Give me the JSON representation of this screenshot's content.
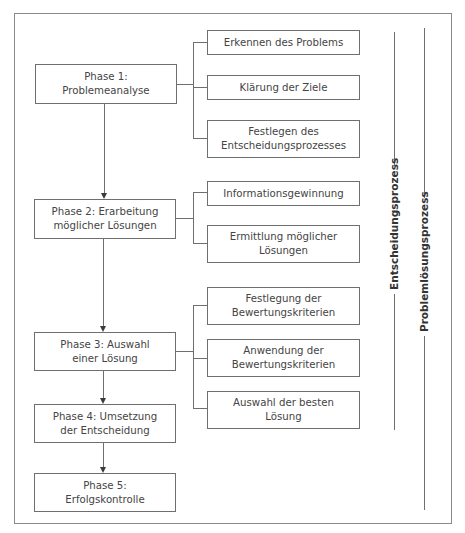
{
  "phases": [
    {
      "label": "Phase 1:\nProblemeanalyse",
      "line1": "Phase 1:",
      "line2": "Problemeanalyse"
    },
    {
      "label": "Phase 2: Erarbeitung möglicher Lösungen",
      "line1": "Phase 2: Erarbeitung",
      "line2": "möglicher Lösungen"
    },
    {
      "label": "Phase 3: Auswahl einer Lösung",
      "line1": "Phase 3: Auswahl",
      "line2": "einer Lösung"
    },
    {
      "label": "Phase 4: Umsetzung der Entscheidung",
      "line1": "Phase 4: Umsetzung",
      "line2": "der Entscheidung"
    },
    {
      "label": "Phase 5: Erfolgskontrolle",
      "line1": "Phase 5:",
      "line2": "Erfolgskontrolle"
    }
  ],
  "substeps": {
    "phase1": [
      {
        "line1": "Erkennen des Problems",
        "line2": ""
      },
      {
        "line1": "Klärung der Ziele",
        "line2": ""
      },
      {
        "line1": "Festlegen des",
        "line2": "Entscheidungsprozesses"
      }
    ],
    "phase2": [
      {
        "line1": "Informationsgewinnung",
        "line2": ""
      },
      {
        "line1": "Ermittlung möglicher",
        "line2": "Lösungen"
      }
    ],
    "phase3": [
      {
        "line1": "Festlegung der",
        "line2": "Bewertungskriterien"
      },
      {
        "line1": "Anwendung der",
        "line2": "Bewertungskriterien"
      },
      {
        "line1": "Auswahl der besten",
        "line2": "Lösung"
      }
    ]
  },
  "brackets": {
    "decision_process": "Entscheidungsprozess",
    "problem_solving_process": "Problemlösungsprozess"
  }
}
